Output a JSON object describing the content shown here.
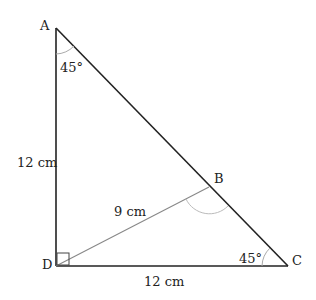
{
  "diagram": {
    "type": "geometry-triangle",
    "points": {
      "A": {
        "label": "A",
        "x": 56,
        "y": 28
      },
      "B": {
        "label": "B",
        "x": 209,
        "y": 187
      },
      "C": {
        "label": "C",
        "x": 288,
        "y": 266
      },
      "D": {
        "label": "D",
        "x": 56,
        "y": 266
      }
    },
    "angles": {
      "A": "45°",
      "C": "45°"
    },
    "lengths": {
      "AD": "12 cm",
      "DC": "12 cm",
      "DB": "9 cm"
    },
    "colors": {
      "main_line": "#222222",
      "secondary_line": "#888888",
      "arc": "#aaaaaa"
    }
  }
}
